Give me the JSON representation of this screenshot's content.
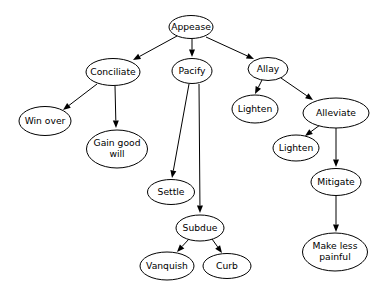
{
  "diagram": {
    "type": "directed-graph",
    "background_color": "#ffffff",
    "node_fill": "#ffffff",
    "node_stroke": "#000000",
    "edge_color": "#000000",
    "nodes": [
      {
        "id": "appease",
        "label": "Appease",
        "lines": [
          "Appease"
        ],
        "cx": 191,
        "cy": 27,
        "rx": 22.0,
        "ry": 11.5
      },
      {
        "id": "conciliate",
        "label": "Conciliate",
        "lines": [
          "Conciliate"
        ],
        "cx": 113,
        "cy": 72,
        "rx": 27.0,
        "ry": 13.5
      },
      {
        "id": "pacify",
        "label": "Pacify",
        "lines": [
          "Pacify"
        ],
        "cx": 192,
        "cy": 71,
        "rx": 20.0,
        "ry": 12.5
      },
      {
        "id": "allay",
        "label": "Allay",
        "lines": [
          "Allay"
        ],
        "cx": 268,
        "cy": 69,
        "rx": 20.0,
        "ry": 11.5
      },
      {
        "id": "win-over",
        "label": "Win over",
        "lines": [
          "Win over"
        ],
        "cx": 45,
        "cy": 121,
        "rx": 26.0,
        "ry": 14.5
      },
      {
        "id": "gain-good-will",
        "label": "Gain good will",
        "lines": [
          "Gain good",
          "will"
        ],
        "cx": 117,
        "cy": 149,
        "rx": 30.5,
        "ry": 19.0
      },
      {
        "id": "lighten-1",
        "label": "Lighten",
        "lines": [
          "Lighten"
        ],
        "cx": 255,
        "cy": 109,
        "rx": 23.0,
        "ry": 14.0
      },
      {
        "id": "alleviate",
        "label": "Alleviate",
        "lines": [
          "Alleviate"
        ],
        "cx": 336,
        "cy": 113,
        "rx": 33.0,
        "ry": 15.0
      },
      {
        "id": "lighten-2",
        "label": "Lighten",
        "lines": [
          "Lighten"
        ],
        "cx": 296,
        "cy": 148,
        "rx": 23.0,
        "ry": 13.0
      },
      {
        "id": "mitigate",
        "label": "Mitigate",
        "lines": [
          "Mitigate"
        ],
        "cx": 336,
        "cy": 182,
        "rx": 25.0,
        "ry": 13.5
      },
      {
        "id": "make-less-painful",
        "label": "Make less painful",
        "lines": [
          "Make less",
          "painful"
        ],
        "cx": 335,
        "cy": 252,
        "rx": 32.5,
        "ry": 19.0
      },
      {
        "id": "settle",
        "label": "Settle",
        "lines": [
          "Settle"
        ],
        "cx": 171,
        "cy": 192,
        "rx": 23.5,
        "ry": 12.5
      },
      {
        "id": "subdue",
        "label": "Subdue",
        "lines": [
          "Subdue"
        ],
        "cx": 200,
        "cy": 228,
        "rx": 24.0,
        "ry": 13.0
      },
      {
        "id": "vanquish",
        "label": "Vanquish",
        "lines": [
          "Vanquish"
        ],
        "cx": 167,
        "cy": 266,
        "rx": 27.0,
        "ry": 14.0
      },
      {
        "id": "curb",
        "label": "Curb",
        "lines": [
          "Curb"
        ],
        "cx": 227,
        "cy": 266,
        "rx": 24.0,
        "ry": 12.5
      }
    ],
    "edges": [
      {
        "from": "appease",
        "to": "conciliate",
        "x1": 177,
        "y1": 36,
        "x2": 133,
        "y2": 60
      },
      {
        "from": "appease",
        "to": "pacify",
        "x1": 192,
        "y1": 39,
        "x2": 192,
        "y2": 57
      },
      {
        "from": "appease",
        "to": "allay",
        "x1": 206,
        "y1": 37,
        "x2": 254,
        "y2": 59
      },
      {
        "from": "conciliate",
        "to": "win-over",
        "x1": 97,
        "y1": 84,
        "x2": 63,
        "y2": 110
      },
      {
        "from": "conciliate",
        "to": "gain-good-will",
        "x1": 115,
        "y1": 86,
        "x2": 116,
        "y2": 128
      },
      {
        "from": "pacify",
        "to": "settle",
        "x1": 189,
        "y1": 84,
        "x2": 172,
        "y2": 178
      },
      {
        "from": "pacify",
        "to": "subdue",
        "x1": 199,
        "y1": 84,
        "x2": 200,
        "y2": 213
      },
      {
        "from": "allay",
        "to": "lighten-1",
        "x1": 262,
        "y1": 80,
        "x2": 255,
        "y2": 94
      },
      {
        "from": "allay",
        "to": "alleviate",
        "x1": 281,
        "y1": 78,
        "x2": 313,
        "y2": 100
      },
      {
        "from": "alleviate",
        "to": "lighten-2",
        "x1": 320,
        "y1": 125,
        "x2": 305,
        "y2": 136
      },
      {
        "from": "alleviate",
        "to": "mitigate",
        "x1": 336,
        "y1": 128,
        "x2": 336,
        "y2": 167
      },
      {
        "from": "mitigate",
        "to": "make-less-painful",
        "x1": 336,
        "y1": 196,
        "x2": 336,
        "y2": 232
      },
      {
        "from": "subdue",
        "to": "vanquish",
        "x1": 189,
        "y1": 239,
        "x2": 177,
        "y2": 252
      },
      {
        "from": "subdue",
        "to": "curb",
        "x1": 212,
        "y1": 239,
        "x2": 222,
        "y2": 253
      }
    ]
  }
}
